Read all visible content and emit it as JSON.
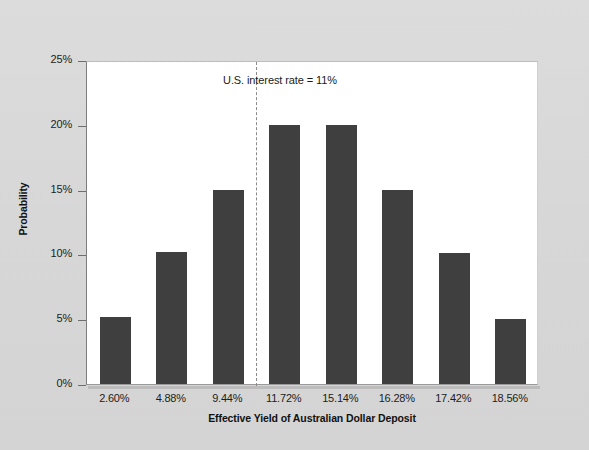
{
  "chart_data": {
    "type": "bar",
    "title": "",
    "subtitle": "",
    "xlabel": "Effective Yield of Australian Dollar Deposit",
    "ylabel": "Probability",
    "categories": [
      "2.60%",
      "4.88%",
      "9.44%",
      "11.72%",
      "15.14%",
      "16.28%",
      "17.42%",
      "18.56%"
    ],
    "values": [
      5.2,
      10.2,
      15.0,
      20.0,
      20.0,
      15.0,
      10.1,
      5.0
    ],
    "value_unit": "%",
    "ylim": [
      0,
      25
    ],
    "y_ticks": [
      0,
      5,
      10,
      15,
      20,
      25
    ],
    "y_tick_labels": [
      "0%",
      "5%",
      "10%",
      "15%",
      "20%",
      "25%"
    ],
    "grid": false,
    "legend": false,
    "legend_position": "none",
    "bar_color": "#3f3f3f",
    "plot_background": "#ffffff",
    "page_background": "#d9d9d9",
    "annotations": [
      {
        "name": "us-interest-rate-reference",
        "text": "U.S. interest rate  =  11%",
        "line_style": "dashed",
        "line_color": "#8b8b8b",
        "x_position_between_categories": [
          "9.44%",
          "11.72%"
        ],
        "value": 11
      }
    ]
  }
}
